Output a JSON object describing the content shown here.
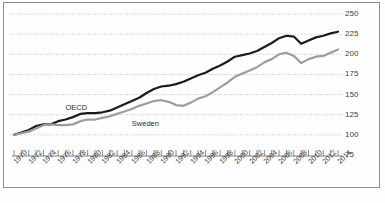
{
  "figure": {
    "caption_fragment": "",
    "background": "#fdfdfc",
    "frame_color": "#8e8e8e"
  },
  "chart_data": {
    "type": "line",
    "title": "",
    "subtitle": "",
    "xlabel": "",
    "ylabel": "",
    "index_base": 100,
    "grid": true,
    "grid_style": "dotted",
    "grid_color": "#9a9a9a",
    "legend": "inline-labels",
    "ylim": [
      75,
      250
    ],
    "yticks": [
      75,
      100,
      125,
      150,
      175,
      200,
      225,
      250
    ],
    "ytick_labels": [
      "75",
      "100",
      "125",
      "150",
      "175",
      "200",
      "225",
      "250"
    ],
    "xlim": [
      1970,
      2014
    ],
    "xtick_labels": [
      "1970",
      "1972",
      "1974",
      "1976",
      "1978",
      "1980",
      "1982",
      "1984",
      "1986",
      "1988",
      "1990",
      "1992",
      "1994",
      "1996",
      "1998",
      "2000",
      "2002",
      "2004",
      "2006",
      "2008",
      "2010",
      "2012",
      "2014"
    ],
    "xtick_step_minor": 1,
    "xtick_step_major": 2,
    "x": [
      1970,
      1971,
      1972,
      1973,
      1974,
      1975,
      1976,
      1977,
      1978,
      1979,
      1980,
      1981,
      1982,
      1983,
      1984,
      1985,
      1986,
      1987,
      1988,
      1989,
      1990,
      1991,
      1992,
      1993,
      1994,
      1995,
      1996,
      1997,
      1998,
      1999,
      2000,
      2001,
      2002,
      2003,
      2004,
      2005,
      2006,
      2007,
      2008,
      2009,
      2010,
      2011,
      2012,
      2013,
      2014
    ],
    "series": [
      {
        "name": "OECD",
        "color": "#1b1b1b",
        "width": 2.2,
        "label_x": 1977,
        "label_y": 133,
        "values": [
          100,
          103,
          106,
          111,
          113,
          113,
          117,
          119,
          122,
          126,
          127,
          127,
          128,
          130,
          134,
          138,
          142,
          146,
          152,
          157,
          160,
          161,
          163,
          166,
          170,
          174,
          177,
          182,
          186,
          191,
          197,
          199,
          201,
          204,
          209,
          214,
          220,
          223,
          222,
          213,
          217,
          221,
          223,
          226,
          228
        ]
      },
      {
        "name": "Sweden",
        "color": "#9d9d9d",
        "width": 2.2,
        "label_x": 1986,
        "label_y": 113,
        "values": [
          100,
          102,
          104,
          108,
          112,
          113,
          112,
          112,
          113,
          117,
          119,
          119,
          121,
          123,
          126,
          129,
          132,
          136,
          139,
          142,
          143,
          141,
          137,
          136,
          140,
          145,
          148,
          153,
          159,
          165,
          172,
          176,
          180,
          184,
          190,
          194,
          200,
          202,
          198,
          189,
          194,
          197,
          198,
          202,
          206
        ]
      }
    ],
    "annotations": [
      {
        "text": "OECD",
        "x": 1977,
        "y": 133
      },
      {
        "text": "Sweden",
        "x": 1986,
        "y": 113
      }
    ]
  }
}
